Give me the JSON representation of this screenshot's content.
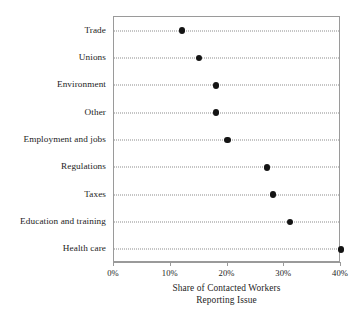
{
  "chart_data": {
    "type": "scatter",
    "subtype": "dot-plot",
    "orientation": "horizontal",
    "title": "",
    "xlabel": "Share of Contacted Workers Reporting Issue",
    "xlabel_lines": [
      "Share of Contacted Workers",
      "Reporting Issue"
    ],
    "ylabel": "",
    "categories": [
      "Trade",
      "Unions",
      "Environment",
      "Other",
      "Employment and jobs",
      "Regulations",
      "Taxes",
      "Education and training",
      "Health care"
    ],
    "values": [
      12,
      15,
      18,
      18,
      20,
      27,
      28,
      31,
      40
    ],
    "value_unit": "%",
    "xlim": [
      0,
      40
    ],
    "xticks": [
      0,
      10,
      20,
      30,
      40
    ],
    "xtick_labels": [
      "0%",
      "10%",
      "20%",
      "30%",
      "40%"
    ],
    "grid": "dotted-horizontal-leader-lines",
    "legend": "none",
    "marker": "filled-circle",
    "marker_color": "#141414",
    "frame_color": "#9a9a9a",
    "leader_color": "#8c8c8c",
    "background": "#ffffff"
  }
}
